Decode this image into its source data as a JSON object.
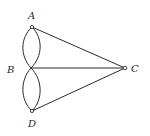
{
  "diagram": {
    "type": "graph",
    "nodes": [
      {
        "id": "A",
        "label": "A"
      },
      {
        "id": "B",
        "label": "B"
      },
      {
        "id": "C",
        "label": "C"
      },
      {
        "id": "D",
        "label": "D"
      }
    ],
    "edges": [
      {
        "from": "A",
        "to": "B",
        "kind": "curve-left"
      },
      {
        "from": "A",
        "to": "B",
        "kind": "curve-right"
      },
      {
        "from": "B",
        "to": "D",
        "kind": "curve-left"
      },
      {
        "from": "B",
        "to": "D",
        "kind": "curve-right"
      },
      {
        "from": "A",
        "to": "C",
        "kind": "straight"
      },
      {
        "from": "B",
        "to": "C",
        "kind": "straight"
      },
      {
        "from": "D",
        "to": "C",
        "kind": "straight"
      }
    ]
  }
}
